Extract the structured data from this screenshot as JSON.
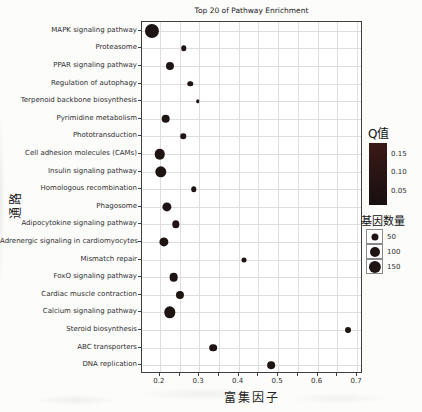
{
  "figure": {
    "title": "Top 20 of Pathway Enrichment",
    "x_axis_label": "富集因子",
    "y_axis_label": "通路"
  },
  "legend": {
    "color_title": "Q值",
    "color_ticks": [
      "0.15",
      "0.10",
      "0.05"
    ],
    "size_title": "基因数量",
    "size_ticks": [
      50,
      100,
      150
    ]
  },
  "chart_data": {
    "type": "scatter",
    "subtype": "bubble-dotplot",
    "title": "Top 20 of Pathway Enrichment",
    "xlabel": "富集因子",
    "ylabel": "通路",
    "xlim": [
      0.155,
      0.715
    ],
    "x_ticks": [
      0.2,
      0.3,
      0.4,
      0.5,
      0.6,
      0.7
    ],
    "x_grid_step": 0.05,
    "grid": true,
    "legend_position": "right",
    "categories": [
      "MAPK signaling pathway",
      "Proteasome",
      "PPAR signaling pathway",
      "Regulation of autophagy",
      "Terpenoid backbone biosynthesis",
      "Pyrimidine metabolism",
      "Phototransduction",
      "Cell adhesion molecules (CAMs)",
      "Insulin signaling pathway",
      "Homologous recombination",
      "Phagosome",
      "Adipocytokine signaling pathway",
      "Adrenergic signaling in cardiomyocytes",
      "Mismatch repair",
      "FoxO signaling pathway",
      "Cardiac muscle contraction",
      "Calcium signaling pathway",
      "Steroid biosynthesis",
      "ABC transporters",
      "DNA replication"
    ],
    "series": [
      {
        "name": "Pathway enrichment",
        "x_name": "enrichment_factor",
        "size_name": "gene_count",
        "values": [
          0.181,
          0.261,
          0.226,
          0.277,
          0.296,
          0.215,
          0.26,
          0.2,
          0.202,
          0.286,
          0.219,
          0.241,
          0.211,
          0.413,
          0.235,
          0.25,
          0.226,
          0.677,
          0.336,
          0.482
        ],
        "sizes": [
          200,
          30,
          65,
          30,
          12,
          75,
          30,
          110,
          130,
          30,
          85,
          55,
          85,
          25,
          75,
          65,
          130,
          35,
          60,
          60
        ]
      }
    ]
  },
  "style": {
    "bubble_color": "#1d1413",
    "colorbar_top": "#3a1917",
    "colorbar_bottom": "#171010",
    "grid_color": "#dedede",
    "frame_color": "#3f3f3f"
  }
}
